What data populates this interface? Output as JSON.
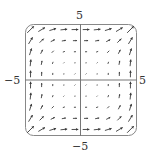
{
  "diagram": {
    "type": "vector-field",
    "field": {
      "P": "y^2",
      "Q": "x^2"
    },
    "grid": {
      "n": 10,
      "xrange": [
        -5,
        5
      ],
      "yrange": [
        -5,
        5
      ]
    },
    "axis_labels": {
      "top": "5",
      "bottom": "−5",
      "left": "−5",
      "right": "5"
    },
    "colors": {
      "arrow": "#3a3a3a",
      "frame": "#888888",
      "axis": "#777777"
    }
  }
}
